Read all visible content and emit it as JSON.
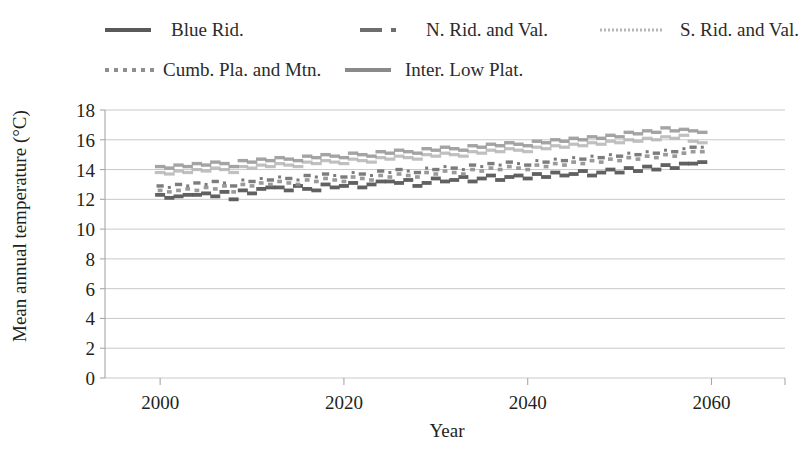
{
  "chart_data": {
    "type": "scatter",
    "title": "",
    "xlabel": "Year",
    "ylabel": "Mean annual temperature (°C)",
    "xlim": [
      1994,
      2068
    ],
    "ylim": [
      0,
      18
    ],
    "xticks": [
      2000,
      2020,
      2040,
      2060
    ],
    "yticks": [
      0,
      2,
      4,
      6,
      8,
      10,
      12,
      14,
      16,
      18
    ],
    "grid": "horizontal",
    "legend_position": "top",
    "x": [
      2000,
      2001,
      2002,
      2003,
      2004,
      2005,
      2006,
      2007,
      2008,
      2009,
      2010,
      2011,
      2012,
      2013,
      2014,
      2015,
      2016,
      2017,
      2018,
      2019,
      2020,
      2021,
      2022,
      2023,
      2024,
      2025,
      2026,
      2027,
      2028,
      2029,
      2030,
      2031,
      2032,
      2033,
      2034,
      2035,
      2036,
      2037,
      2038,
      2039,
      2040,
      2041,
      2042,
      2043,
      2044,
      2045,
      2046,
      2047,
      2048,
      2049,
      2050,
      2051,
      2052,
      2053,
      2054,
      2055,
      2056,
      2057,
      2058,
      2059
    ],
    "series": [
      {
        "name": "Blue Rid.",
        "marker": "solid-dark",
        "color": "#595959",
        "values": [
          12.3,
          12.1,
          12.2,
          12.3,
          12.3,
          12.4,
          12.2,
          12.5,
          12.0,
          12.6,
          12.4,
          12.7,
          12.8,
          12.8,
          12.6,
          12.9,
          12.7,
          12.6,
          13.0,
          12.8,
          12.9,
          13.1,
          12.8,
          13.0,
          13.2,
          13.2,
          13.1,
          13.3,
          12.9,
          13.1,
          13.4,
          13.2,
          13.3,
          13.5,
          13.2,
          13.4,
          13.6,
          13.3,
          13.5,
          13.6,
          13.4,
          13.7,
          13.5,
          13.8,
          13.6,
          13.7,
          13.9,
          13.6,
          13.8,
          14.0,
          13.8,
          14.1,
          13.9,
          14.2,
          14.0,
          14.3,
          14.1,
          14.4,
          14.4,
          14.5
        ]
      },
      {
        "name": "N. Rid. and Val.",
        "marker": "dashdot-dark",
        "color": "#6e6e6e",
        "values": [
          12.9,
          12.8,
          13.0,
          12.9,
          13.1,
          13.0,
          13.2,
          13.1,
          12.9,
          13.3,
          13.2,
          13.4,
          13.3,
          13.5,
          13.4,
          13.3,
          13.6,
          13.5,
          13.7,
          13.6,
          13.5,
          13.8,
          13.7,
          13.6,
          13.9,
          13.8,
          14.0,
          13.9,
          13.8,
          14.1,
          14.0,
          14.2,
          14.1,
          14.0,
          14.3,
          14.2,
          14.4,
          14.3,
          14.5,
          14.4,
          14.3,
          14.6,
          14.5,
          14.7,
          14.6,
          14.8,
          14.7,
          14.9,
          14.8,
          15.0,
          14.9,
          15.1,
          15.0,
          15.2,
          15.1,
          15.3,
          15.2,
          15.4,
          15.5,
          15.5
        ]
      },
      {
        "name": "S. Rid. and Val.",
        "marker": "dots-light",
        "color": "#b5b5b5",
        "values": [
          13.8,
          13.7,
          13.9,
          13.8,
          14.0,
          13.9,
          14.1,
          14.0,
          13.8,
          14.2,
          14.1,
          14.3,
          14.2,
          14.4,
          14.3,
          14.2,
          14.5,
          14.4,
          14.6,
          14.5,
          14.4,
          14.7,
          14.6,
          14.5,
          14.8,
          14.7,
          14.9,
          14.8,
          14.7,
          15.0,
          14.9,
          15.1,
          15.0,
          14.9,
          15.2,
          15.1,
          15.3,
          15.2,
          15.4,
          15.3,
          15.2,
          15.5,
          15.4,
          15.6,
          15.5,
          15.7,
          15.6,
          15.8,
          15.7,
          15.9,
          15.8,
          16.0,
          15.9,
          16.1,
          16.0,
          16.2,
          16.1,
          16.3,
          15.9,
          15.8
        ]
      },
      {
        "name": "Cumb. Pla. and Mtn.",
        "marker": "dots-mid",
        "color": "#8f8f8f",
        "values": [
          12.6,
          12.5,
          12.6,
          12.7,
          12.6,
          12.8,
          12.7,
          12.9,
          12.5,
          13.0,
          12.9,
          13.1,
          13.0,
          13.2,
          13.1,
          13.0,
          13.3,
          13.2,
          13.4,
          13.3,
          13.2,
          13.5,
          13.4,
          13.3,
          13.6,
          13.5,
          13.7,
          13.6,
          13.5,
          13.8,
          13.7,
          13.9,
          13.8,
          13.7,
          14.0,
          13.9,
          14.1,
          14.0,
          14.2,
          14.1,
          14.0,
          14.3,
          14.2,
          14.4,
          14.3,
          14.5,
          14.4,
          14.6,
          14.5,
          14.7,
          14.6,
          14.8,
          14.7,
          14.9,
          14.8,
          15.0,
          14.9,
          15.1,
          15.2,
          15.2
        ]
      },
      {
        "name": "Inter. Low Plat.",
        "marker": "solid-mid",
        "color": "#9a9a9a",
        "values": [
          14.2,
          14.1,
          14.3,
          14.2,
          14.4,
          14.3,
          14.5,
          14.4,
          14.2,
          14.6,
          14.5,
          14.7,
          14.6,
          14.8,
          14.7,
          14.6,
          14.9,
          14.8,
          15.0,
          14.9,
          14.8,
          15.1,
          15.0,
          14.9,
          15.2,
          15.1,
          15.3,
          15.2,
          15.1,
          15.4,
          15.3,
          15.5,
          15.4,
          15.3,
          15.6,
          15.5,
          15.7,
          15.6,
          15.8,
          15.7,
          15.6,
          15.9,
          15.8,
          16.0,
          15.9,
          16.1,
          16.0,
          16.2,
          16.1,
          16.3,
          16.2,
          16.5,
          16.4,
          16.6,
          16.5,
          16.8,
          16.6,
          16.7,
          16.6,
          16.5
        ]
      }
    ]
  },
  "legend": {
    "rows": [
      [
        {
          "label": "Blue Rid.",
          "marker": "solid-dark"
        },
        {
          "label": "N. Rid. and Val.",
          "marker": "dashdot-dark"
        },
        {
          "label": "S. Rid. and Val.",
          "marker": "dots-light"
        }
      ],
      [
        {
          "label": "Cumb. Pla. and Mtn.",
          "marker": "dots-mid"
        },
        {
          "label": "Inter. Low Plat.",
          "marker": "solid-mid"
        }
      ]
    ]
  },
  "axes": {
    "ylabel": "Mean annual temperature (°C)",
    "xlabel": "Year",
    "yticks": [
      "18",
      "16",
      "14",
      "12",
      "10",
      "8",
      "6",
      "4",
      "2",
      "0"
    ],
    "xticks": [
      "2000",
      "2020",
      "2040",
      "2060"
    ]
  },
  "colors": {
    "blue_rid": "#595959",
    "n_rid_val": "#6e6e6e",
    "s_rid_val": "#b5b5b5",
    "cumb_pla": "#8f8f8f",
    "inter_low": "#9a9a9a",
    "grid": "#c9c9c9",
    "axis": "#a8a8a8",
    "text": "#231f20"
  }
}
